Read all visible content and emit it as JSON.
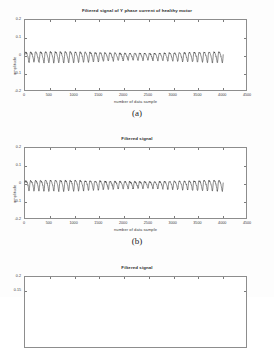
{
  "figure": {
    "panels": [
      {
        "id": "panel-a",
        "caption": "(a)",
        "title": "Filtered signal of Y phase current of healthy motor",
        "xlabel": "number of data sample",
        "ylabel": "amplitude",
        "yticks": [
          "0.2",
          "0.1",
          "0",
          "-0.1",
          "-0.2"
        ],
        "xticks": [
          "0",
          "500",
          "1000",
          "1500",
          "2000",
          "2500",
          "3000",
          "3500",
          "4000",
          "4500"
        ]
      },
      {
        "id": "panel-b",
        "caption": "(b)",
        "title": "Filtered signal",
        "xlabel": "number of data sample",
        "ylabel": "amplitude",
        "yticks": [
          "0.2",
          "0.1",
          "0",
          "-0.1",
          "-0.2"
        ],
        "xticks": [
          "0",
          "500",
          "1000",
          "1500",
          "2000",
          "2500",
          "3000",
          "3500",
          "4000",
          "4500"
        ]
      },
      {
        "id": "panel-c",
        "caption": "",
        "title": "Filtered signal",
        "xlabel": "",
        "ylabel": "",
        "yticks": [
          "0.2",
          "0.15"
        ],
        "xticks": []
      }
    ]
  },
  "chart_data": [
    {
      "type": "line",
      "title": "Filtered signal of Y phase current of healthy motor",
      "xlabel": "number of data sample",
      "ylabel": "amplitude",
      "xlim": [
        0,
        4500
      ],
      "ylim": [
        -0.2,
        0.2
      ],
      "xticks": [
        0,
        500,
        1000,
        1500,
        2000,
        2500,
        3000,
        3500,
        4000,
        4500
      ],
      "yticks": [
        -0.2,
        -0.1,
        0,
        0.1,
        0.2
      ],
      "grid": false,
      "legend": "none",
      "series": [
        {
          "name": "Y phase filtered current (healthy motor)",
          "description": "Quasi-periodic oscillation centred on 0 amplitude, roughly 40 cycles spanning samples 0 to 4000, peak amplitude about +0.035 and trough about -0.040, sharp saw-like peaks with fine high-frequency ripple; no data plotted beyond sample 4000.",
          "x_range": [
            0,
            4000
          ],
          "cycles": 40,
          "mean": 0.0,
          "peak_amplitude": 0.035,
          "trough_amplitude": -0.04
        }
      ]
    },
    {
      "type": "line",
      "title": "Filtered signal",
      "xlabel": "number of data sample",
      "ylabel": "amplitude",
      "xlim": [
        0,
        4500
      ],
      "ylim": [
        -0.2,
        0.2
      ],
      "xticks": [
        0,
        500,
        1000,
        1500,
        2000,
        2500,
        3000,
        3500,
        4000,
        4500
      ],
      "yticks": [
        -0.2,
        -0.1,
        0,
        0.1,
        0.2
      ],
      "grid": false,
      "legend": "none",
      "series": [
        {
          "name": "Filtered signal",
          "description": "Quasi-periodic oscillation centred on 0 amplitude, roughly 40 cycles spanning samples 0 to 4000, peak amplitude about +0.030 and trough about -0.042, asymmetric spiky troughs; no data plotted beyond sample 4000.",
          "x_range": [
            0,
            4000
          ],
          "cycles": 40,
          "mean": 0.0,
          "peak_amplitude": 0.03,
          "trough_amplitude": -0.042
        }
      ]
    },
    {
      "type": "line",
      "title": "Filtered signal",
      "xlabel": "",
      "ylabel": "",
      "xlim": [
        0,
        4500
      ],
      "ylim": [
        0.15,
        0.2
      ],
      "xticks": [],
      "yticks": [
        0.15,
        0.2
      ],
      "grid": false,
      "legend": "none",
      "series": [
        {
          "name": "Filtered signal",
          "description": "Third panel is cropped by the bottom edge of the screenshot; only the top of the axes box and the upper two y tick labels are visible, no trace data shown.",
          "cropped": true
        }
      ]
    }
  ]
}
